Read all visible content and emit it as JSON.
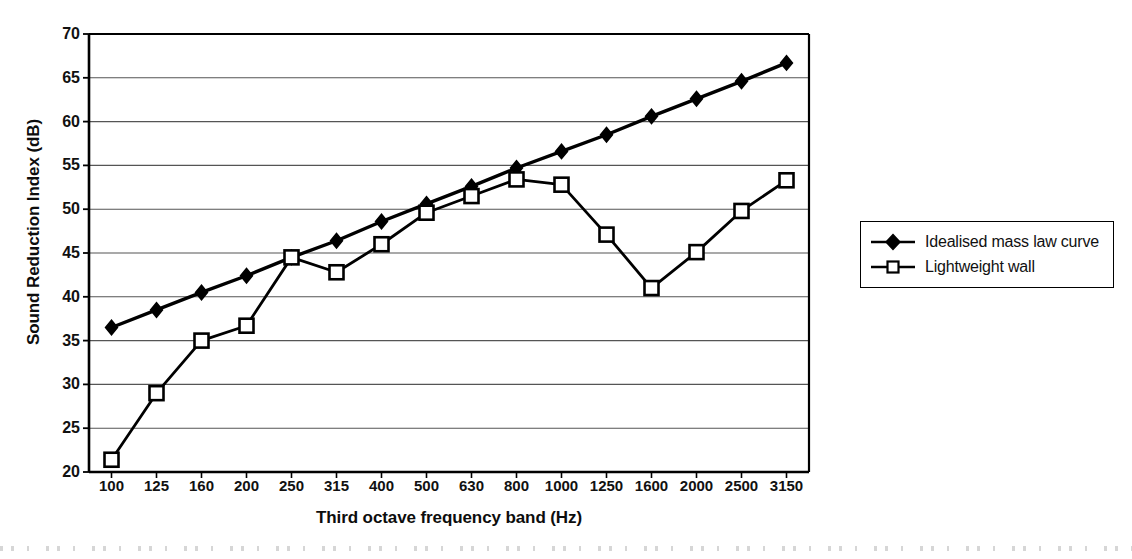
{
  "chart_data": {
    "type": "line",
    "title": "",
    "xlabel": "Third octave frequency band (Hz)",
    "ylabel": "Sound Reduction Index (dB)",
    "categories": [
      "100",
      "125",
      "160",
      "200",
      "250",
      "315",
      "400",
      "500",
      "630",
      "800",
      "1000",
      "1250",
      "1600",
      "2000",
      "2500",
      "3150"
    ],
    "ylim": [
      20,
      70
    ],
    "yticks": [
      20,
      25,
      30,
      35,
      40,
      45,
      50,
      55,
      60,
      65,
      70
    ],
    "grid": "horizontal",
    "legend_position": "right",
    "series": [
      {
        "name": "Idealised mass law curve",
        "marker": "filled-diamond",
        "values": [
          36.5,
          38.5,
          40.5,
          42.4,
          44.5,
          46.4,
          48.6,
          50.6,
          52.6,
          54.7,
          56.6,
          58.5,
          60.6,
          62.6,
          64.6,
          66.7
        ]
      },
      {
        "name": "Lightweight wall",
        "marker": "open-square",
        "values": [
          21.4,
          29.0,
          35.0,
          36.7,
          44.5,
          42.8,
          46.0,
          49.6,
          51.5,
          53.4,
          52.8,
          47.1,
          41.0,
          45.1,
          49.8,
          53.3
        ]
      }
    ]
  },
  "axes": {
    "y_title": "Sound Reduction Index (dB)",
    "x_title": "Third octave frequency band (Hz)",
    "y_tick_labels": [
      "70",
      "65",
      "60",
      "55",
      "50",
      "45",
      "40",
      "35",
      "30",
      "25",
      "20"
    ],
    "x_tick_labels": [
      "100",
      "125",
      "160",
      "200",
      "250",
      "315",
      "400",
      "500",
      "630",
      "800",
      "1000",
      "1250",
      "1600",
      "2000",
      "2500",
      "3150"
    ]
  },
  "legend": {
    "entries": [
      {
        "label": "Idealised mass law curve",
        "marker": "filled-diamond"
      },
      {
        "label": "Lightweight wall",
        "marker": "open-square"
      }
    ]
  },
  "colors": {
    "line": "#000000",
    "grid": "#555555",
    "axis": "#000000",
    "background": "#ffffff"
  }
}
